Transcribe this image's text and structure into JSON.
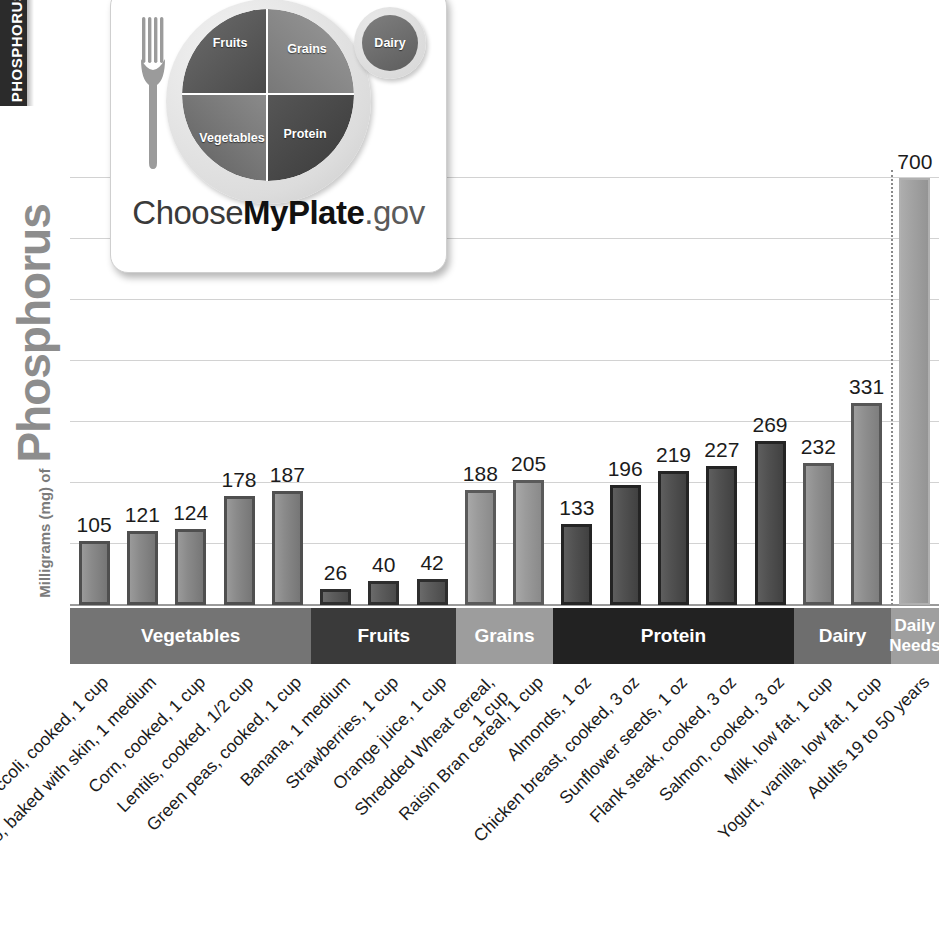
{
  "tab": {
    "label": "PHOSPHORUS"
  },
  "axis": {
    "y_title_small": "Milligrams (mg) of",
    "y_title_big": "Phosphorus"
  },
  "logo": {
    "name": "ChooseMyPlate.gov",
    "part1": "Choose",
    "part2": "MyPlate",
    "part3": ".gov",
    "plate_sections": {
      "fruits": "Fruits",
      "grains": "Grains",
      "vegetables": "Vegetables",
      "protein": "Protein",
      "dairy": "Dairy"
    }
  },
  "groups": [
    {
      "key": "veg",
      "label": "Vegetables",
      "color": "#747474",
      "count": 5
    },
    {
      "key": "fruits",
      "label": "Fruits",
      "color": "#3a3a3a",
      "count": 3
    },
    {
      "key": "grains",
      "label": "Grains",
      "color": "#9d9d9d",
      "count": 2
    },
    {
      "key": "protein",
      "label": "Protein",
      "color": "#222222",
      "count": 5
    },
    {
      "key": "dairy",
      "label": "Dairy",
      "color": "#6e6e6e",
      "count": 2
    },
    {
      "key": "needs",
      "label": "Daily\nNeeds",
      "color": "#9f9f9f",
      "count": 1
    }
  ],
  "chart_data": {
    "type": "bar",
    "title": "Milligrams (mg) of Phosphorus",
    "xlabel": "",
    "ylabel": "Milligrams (mg) of Phosphorus",
    "ylim": [
      0,
      745
    ],
    "grid": true,
    "gridlines": [
      100,
      200,
      300,
      400,
      500,
      600,
      700
    ],
    "legend": "none",
    "categories": [
      "Broccoli, cooked, 1 cup",
      "Potato, baked with skin, 1 medium",
      "Corn, cooked, 1 cup",
      "Lentils, cooked, 1/2 cup",
      "Green peas, cooked, 1 cup",
      "Banana, 1 medium",
      "Strawberries, 1 cup",
      "Orange juice, 1 cup",
      "Shredded Wheat cereal, 1 cup",
      "Raisin Bran cereal, 1 cup",
      "Almonds, 1 oz",
      "Chicken breast, cooked, 3 oz",
      "Sunflower seeds, 1 oz",
      "Flank steak, cooked, 3 oz",
      "Salmon, cooked, 3 oz",
      "Milk, low fat, 1 cup",
      "Yogurt, vanilla, low fat, 1 cup",
      "Adults 19 to 50 years"
    ],
    "values": [
      105,
      121,
      124,
      178,
      187,
      26,
      40,
      42,
      188,
      205,
      133,
      196,
      219,
      227,
      269,
      232,
      331,
      700
    ],
    "group_of": [
      "veg",
      "veg",
      "veg",
      "veg",
      "veg",
      "fruits",
      "fruits",
      "fruits",
      "grains",
      "grains",
      "protein",
      "protein",
      "protein",
      "protein",
      "protein",
      "dairy",
      "dairy",
      "needs"
    ],
    "label_lines": [
      [
        "Broccoli, cooked, 1 cup"
      ],
      [
        "Potato, baked with skin, 1 medium"
      ],
      [
        "Corn, cooked, 1 cup"
      ],
      [
        "Lentils, cooked, 1/2 cup"
      ],
      [
        "Green peas, cooked, 1 cup"
      ],
      [
        "Banana, 1 medium"
      ],
      [
        "Strawberries, 1 cup"
      ],
      [
        "Orange juice, 1 cup"
      ],
      [
        "Shredded Wheat cereal,",
        "1 cup"
      ],
      [
        "Raisin Bran cereal, 1 cup"
      ],
      [
        "Almonds, 1 oz"
      ],
      [
        "Chicken breast, cooked, 3 oz"
      ],
      [
        "Sunflower seeds, 1 oz"
      ],
      [
        "Flank steak, cooked, 3 oz"
      ],
      [
        "Salmon, cooked, 3 oz"
      ],
      [
        "Milk, low fat, 1 cup"
      ],
      [
        "Yogurt, vanilla, low fat, 1 cup"
      ],
      [
        "Adults 19 to 50 years"
      ]
    ]
  },
  "colors": {
    "veg_bar": "#8a8a8a",
    "fruits_bar": "#5c5c5c",
    "grains_bar": "#9b9b9b",
    "protein_bar": "#515151",
    "dairy_bar": "#8f8f8f",
    "needs_bar": "#a2a2a2",
    "gridline": "#d2d2d2",
    "tab": "#2b2b2b"
  }
}
